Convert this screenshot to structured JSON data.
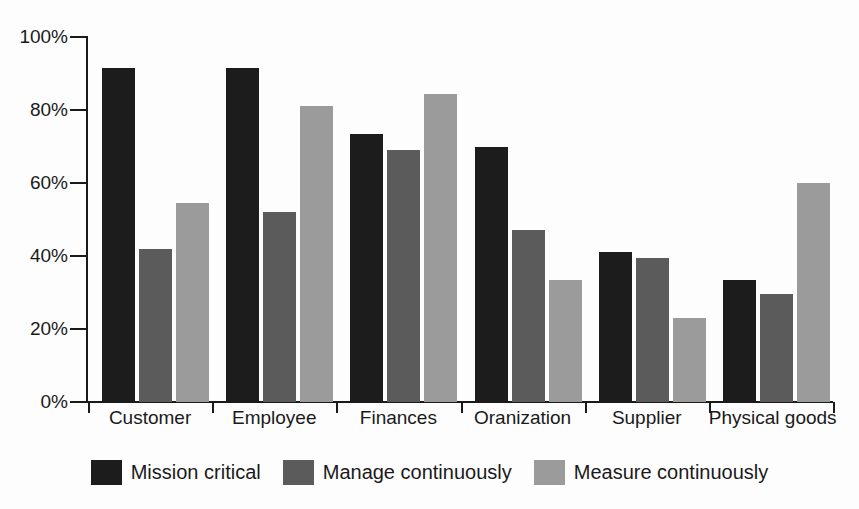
{
  "chart_data": {
    "type": "bar",
    "title": "",
    "xlabel": "",
    "ylabel": "",
    "ylim": [
      0,
      100
    ],
    "grid": false,
    "legend_position": "bottom-center",
    "y_tick_labels": [
      "100%",
      "80%",
      "60%",
      "40%",
      "20%",
      "0%"
    ],
    "y_tick_values": [
      100,
      80,
      60,
      40,
      20,
      0
    ],
    "categories": [
      "Customer",
      "Employee",
      "Finances",
      "Oranization",
      "Supplier",
      "Physical goods"
    ],
    "series": [
      {
        "name": "Mission critical",
        "color": "#1c1c1c",
        "values": [
          91.5,
          91.5,
          73.5,
          70.0,
          41.0,
          33.5
        ]
      },
      {
        "name": "Manage continuously",
        "color": "#5b5b5b",
        "values": [
          42.0,
          52.0,
          69.0,
          47.0,
          39.5,
          29.5
        ]
      },
      {
        "name": "Measure continuously",
        "color": "#9b9b9b",
        "values": [
          54.5,
          81.0,
          84.5,
          33.5,
          23.0,
          60.0
        ]
      }
    ]
  },
  "legend": {
    "items": [
      {
        "label": "Mission critical",
        "swatch": "legend-swatch-black"
      },
      {
        "label": "Manage continuously",
        "swatch": "legend-swatch-dark-gray"
      },
      {
        "label": "Measure continuously",
        "swatch": "legend-swatch-light-gray"
      }
    ]
  },
  "colors": {
    "series_1": "#1c1c1c",
    "series_2": "#5b5b5b",
    "series_3": "#9b9b9b",
    "axis": "#1a1a1a",
    "background": "#fdfdfd"
  }
}
